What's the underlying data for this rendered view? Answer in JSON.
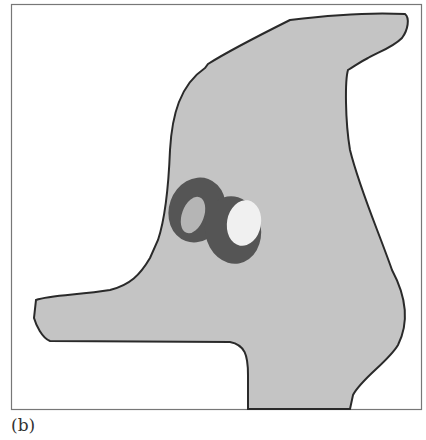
{
  "figure": {
    "caption": "(b)",
    "colors": {
      "frame": "#777777",
      "shape_fill": "#c4c4c4",
      "shape_outline": "#2a2a2a",
      "ring": "#555555",
      "inner_left": "#b5b5b5",
      "inner_right": "#f0f0f0"
    },
    "elements": [
      {
        "name": "frame",
        "description": "rectangular border"
      },
      {
        "name": "head-shape",
        "description": "gray silhouette resembling a bird/dog head with long snout"
      },
      {
        "name": "eye-left",
        "description": "dark oval ring with gray interior"
      },
      {
        "name": "eye-right",
        "description": "dark oval ring with white interior"
      }
    ]
  }
}
